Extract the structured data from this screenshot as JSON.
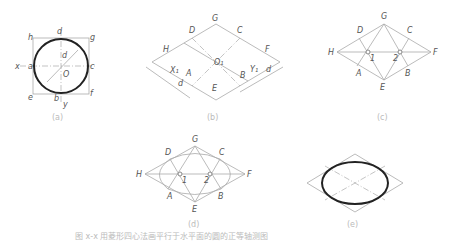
{
  "figure": {
    "caption": "图 x-x 用菱形四心法画平行于水平面的圆的正等轴测图",
    "panels": [
      {
        "id": "a",
        "label": "(a)",
        "points": [
          "h",
          "d",
          "g",
          "x",
          "a",
          "b_top",
          "c",
          "O",
          "e",
          "b",
          "y",
          "f"
        ]
      },
      {
        "id": "b",
        "label": "(b)",
        "points": [
          "G",
          "D",
          "C",
          "H",
          "F",
          "O1",
          "X1",
          "A",
          "B",
          "Y1",
          "E",
          "d_left",
          "d_right"
        ]
      },
      {
        "id": "c",
        "label": "(c)",
        "points": [
          "G",
          "D",
          "C",
          "H",
          "F",
          "1",
          "2",
          "A",
          "B",
          "E"
        ]
      },
      {
        "id": "d",
        "label": "(d)",
        "points": [
          "G",
          "D",
          "C",
          "H",
          "F",
          "1",
          "2",
          "A",
          "B",
          "E"
        ]
      },
      {
        "id": "e",
        "label": "(e)",
        "points": []
      }
    ]
  },
  "labels": {
    "a": {
      "h": "h",
      "d": "d",
      "g": "g",
      "x": "x",
      "a": "a",
      "b2": "b",
      "c": "c",
      "O": "O",
      "e": "e",
      "b": "b",
      "y": "y",
      "f": "f",
      "dia": "d",
      "cap": "(a)"
    },
    "b": {
      "G": "G",
      "D": "D",
      "C": "C",
      "H": "H",
      "F": "F",
      "O1": "O₁",
      "X1": "X₁",
      "A": "A",
      "B": "B",
      "Y1": "Y₁",
      "d1": "d",
      "d2": "d",
      "E": "E",
      "cap": "(b)"
    },
    "c": {
      "G": "G",
      "D": "D",
      "C": "C",
      "H": "H",
      "F": "F",
      "n1": "1",
      "n2": "2",
      "A": "A",
      "B": "B",
      "E": "E",
      "cap": "(c)"
    },
    "d": {
      "G": "G",
      "D": "D",
      "C": "C",
      "H": "H",
      "F": "F",
      "n1": "1",
      "n2": "2",
      "A": "A",
      "B": "B",
      "E": "E",
      "cap": "(d)"
    },
    "e": {
      "cap": "(e)"
    }
  }
}
